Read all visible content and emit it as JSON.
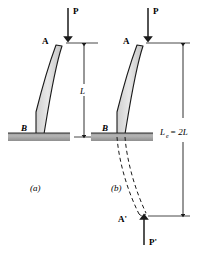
{
  "figure": {
    "background_color": "#ffffff",
    "ink_color": "#1a1a1a",
    "column_fill": "#d9d9d9",
    "support_fill": "#a8a8a8",
    "panels": [
      {
        "key": "a",
        "caption": "(a)",
        "load_label": "P",
        "top_point_label": "A",
        "base_point_label": "B",
        "dimension_label": "L",
        "dimension_sub": "",
        "has_dashed_mirror": false
      },
      {
        "key": "b",
        "caption": "(b)",
        "load_label": "P",
        "top_point_label": "A",
        "base_point_label": "B",
        "dimension_label": "L",
        "dimension_sub": "e",
        "dimension_equals": "= 2L",
        "has_dashed_mirror": true,
        "mirror_point_label": "A'",
        "mirror_load_label": "P'"
      }
    ],
    "labels": {
      "load_a": "P",
      "point_a_top": "A",
      "point_a_base": "B",
      "dim_a": "L",
      "caption_a": "(a)",
      "load_b": "P",
      "point_b_top": "A",
      "point_b_base": "B",
      "dim_b_main": "L",
      "dim_b_sub": "e",
      "dim_b_rest": "= 2L",
      "caption_b": "(b)",
      "mirror_point": "A'",
      "mirror_load": "P'"
    }
  }
}
